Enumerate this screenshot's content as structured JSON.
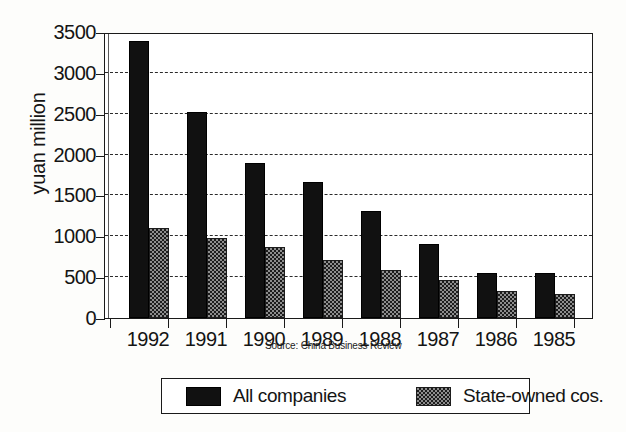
{
  "chart_data": {
    "type": "bar",
    "title": "",
    "subtitle": "",
    "xlabel": "",
    "ylabel": "yuan million",
    "ylim": [
      0,
      3500
    ],
    "ytick_values": [
      0,
      500,
      1000,
      1500,
      2000,
      2500,
      3000,
      3500
    ],
    "ytick_labels": [
      "0",
      "500",
      "1000",
      "1500",
      "2000",
      "2500",
      "3000",
      "3500"
    ],
    "grid": "horizontal-dashed",
    "legend_position": "bottom",
    "categories": [
      "1992",
      "1991",
      "1990",
      "1989",
      "1988",
      "1987",
      "1986",
      "1985"
    ],
    "series": [
      {
        "name": "All companies",
        "color": "#111111",
        "fill": "solid-black",
        "values": [
          3390,
          2525,
          1900,
          1660,
          1315,
          900,
          545,
          545
        ]
      },
      {
        "name": "State-owned cos.",
        "color": "#8d8d8d",
        "fill": "stippled-gray",
        "values": [
          1100,
          975,
          870,
          710,
          590,
          465,
          330,
          300
        ]
      }
    ],
    "annotations": [
      {
        "name": "source-note",
        "text": "Source: China Business Review"
      }
    ]
  },
  "axis": {
    "ylabel": "yuan million"
  },
  "source": {
    "note": "Source: China Business Review"
  },
  "legend": {
    "items": [
      {
        "label": "All companies",
        "swatch": "solid-black-swatch"
      },
      {
        "label": "State-owned cos.",
        "swatch": "stippled-gray-swatch"
      }
    ]
  }
}
